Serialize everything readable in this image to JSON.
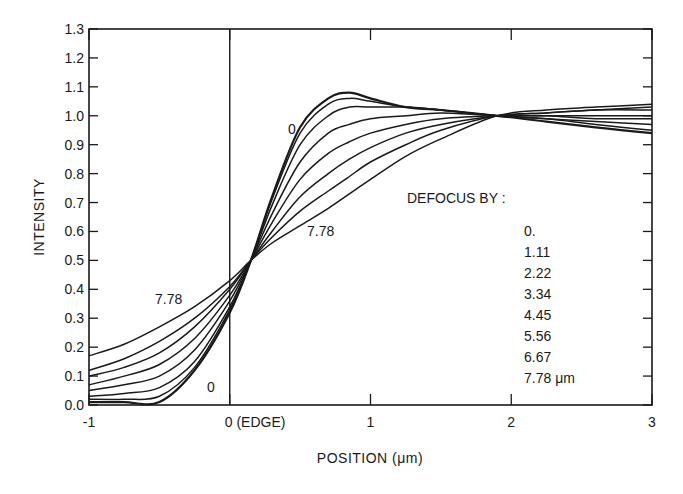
{
  "chart_data": {
    "type": "line",
    "title": "",
    "xlabel": "POSITION (μm)",
    "ylabel": "INTENSITY",
    "xlim": [
      -1,
      3
    ],
    "ylim": [
      0.0,
      1.3
    ],
    "grid": false,
    "x_ticks": [
      {
        "value": -1,
        "label": "-1"
      },
      {
        "value": 0,
        "label": "0 (EDGE)"
      },
      {
        "value": 1,
        "label": "1"
      },
      {
        "value": 2,
        "label": "2"
      },
      {
        "value": 3,
        "label": "3"
      }
    ],
    "y_ticks": [
      {
        "value": 0.0,
        "label": "0.0"
      },
      {
        "value": 0.1,
        "label": "0.1"
      },
      {
        "value": 0.2,
        "label": "0.2"
      },
      {
        "value": 0.3,
        "label": "0.3"
      },
      {
        "value": 0.4,
        "label": "0.4"
      },
      {
        "value": 0.5,
        "label": "0.5"
      },
      {
        "value": 0.6,
        "label": "0.6"
      },
      {
        "value": 0.7,
        "label": "0.7"
      },
      {
        "value": 0.8,
        "label": "0.8"
      },
      {
        "value": 0.9,
        "label": "0.9"
      },
      {
        "value": 1.0,
        "label": "1.0"
      },
      {
        "value": 1.1,
        "label": "1.1"
      },
      {
        "value": 1.2,
        "label": "1.2"
      },
      {
        "value": 1.3,
        "label": "1.3"
      }
    ],
    "vertical_line": {
      "x": 0,
      "label": "EDGE"
    },
    "legend": {
      "title": "DEFOCUS BY :",
      "entries": [
        "0.",
        "1.11",
        "2.22",
        "3.34",
        "4.45",
        "5.56",
        "6.67",
        "7.78 μm"
      ],
      "position": "right-middle"
    },
    "annotations": [
      {
        "text": "0",
        "x": 0.43,
        "y": 0.96,
        "note": "labels 0 defocus curve (upper)"
      },
      {
        "text": "7.78",
        "x": 0.62,
        "y": 0.59,
        "note": "labels 7.78 curve (upper)"
      },
      {
        "text": "7.78",
        "x": -0.45,
        "y": 0.36,
        "note": "labels 7.78 curve (lower)"
      },
      {
        "text": "0",
        "x": -0.13,
        "y": 0.06,
        "note": "labels 0 defocus curve (lower)"
      }
    ],
    "x": [
      -1.0,
      -0.75,
      -0.5,
      -0.25,
      0.0,
      0.15,
      0.3,
      0.5,
      0.7,
      0.85,
      1.0,
      1.25,
      1.5,
      1.9,
      2.25,
      2.6,
      3.0
    ],
    "series": [
      {
        "name": "0.",
        "values": [
          0.01,
          0.01,
          0.01,
          0.12,
          0.32,
          0.5,
          0.72,
          0.96,
          1.06,
          1.08,
          1.06,
          1.03,
          1.02,
          1.0,
          0.98,
          0.96,
          0.94
        ]
      },
      {
        "name": "1.11",
        "values": [
          0.02,
          0.02,
          0.03,
          0.13,
          0.33,
          0.5,
          0.71,
          0.94,
          1.04,
          1.06,
          1.05,
          1.03,
          1.02,
          1.0,
          0.99,
          0.97,
          0.95
        ]
      },
      {
        "name": "2.22",
        "values": [
          0.03,
          0.04,
          0.06,
          0.15,
          0.34,
          0.5,
          0.69,
          0.9,
          1.0,
          1.03,
          1.03,
          1.03,
          1.02,
          1.0,
          0.99,
          0.98,
          0.97
        ]
      },
      {
        "name": "3.34",
        "values": [
          0.05,
          0.07,
          0.1,
          0.19,
          0.36,
          0.5,
          0.66,
          0.84,
          0.94,
          0.97,
          0.99,
          1.0,
          1.01,
          1.0,
          1.0,
          0.99,
          0.99
        ]
      },
      {
        "name": "4.45",
        "values": [
          0.07,
          0.1,
          0.14,
          0.23,
          0.38,
          0.5,
          0.63,
          0.78,
          0.87,
          0.91,
          0.94,
          0.97,
          0.99,
          1.0,
          1.0,
          1.0,
          1.0
        ]
      },
      {
        "name": "5.56",
        "values": [
          0.1,
          0.13,
          0.18,
          0.27,
          0.4,
          0.5,
          0.6,
          0.72,
          0.8,
          0.85,
          0.89,
          0.94,
          0.97,
          1.0,
          1.01,
          1.02,
          1.02
        ]
      },
      {
        "name": "6.67",
        "values": [
          0.12,
          0.16,
          0.22,
          0.3,
          0.41,
          0.5,
          0.58,
          0.67,
          0.74,
          0.79,
          0.84,
          0.9,
          0.95,
          1.0,
          1.01,
          1.02,
          1.03
        ]
      },
      {
        "name": "7.78",
        "values": [
          0.17,
          0.21,
          0.27,
          0.34,
          0.43,
          0.5,
          0.56,
          0.62,
          0.68,
          0.73,
          0.78,
          0.86,
          0.92,
          1.0,
          1.02,
          1.03,
          1.04
        ]
      }
    ]
  }
}
